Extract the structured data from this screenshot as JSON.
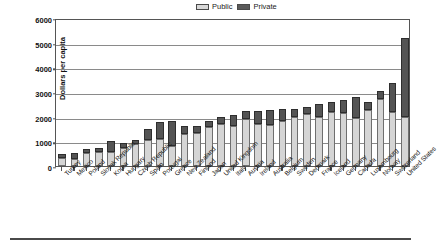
{
  "legend": {
    "entries": [
      {
        "label": "Public",
        "color": "#d5d5d5",
        "key": "public"
      },
      {
        "label": "Private",
        "color": "#545454",
        "key": "private"
      }
    ]
  },
  "axes": {
    "y_title": "Dollars per capita",
    "y_ticks": [
      "0",
      "1000",
      "2000",
      "3000",
      "4000",
      "5000",
      "6000"
    ]
  },
  "chart_data": {
    "type": "bar",
    "subtype": "stacked-vertical",
    "title": "",
    "xlabel": "",
    "ylabel": "Dollars per capita",
    "ylim": [
      0,
      6000
    ],
    "ytick_interval": 1000,
    "grid": true,
    "legend_position": "top-center",
    "sorted": "ascending by total",
    "categories": [
      "Turkey",
      "Mexico",
      "Poland",
      "Slovak Republic",
      "Korea",
      "Hungary",
      "Czech Republic",
      "Spain",
      "Portugal",
      "Greece",
      "New Zealand",
      "Finland",
      "Japan",
      "United Kingdom",
      "Italy",
      "Austria",
      "Ireland",
      "Australia",
      "Belgium",
      "Sweden",
      "Denmark",
      "France",
      "Iceland",
      "Germany",
      "Canada",
      "Luxembourg",
      "Norway",
      "Switzerland",
      "United States"
    ],
    "series": [
      {
        "name": "Public",
        "color": "#d5d5d5",
        "values": [
          310,
          270,
          510,
          550,
          560,
          740,
          900,
          1050,
          1080,
          830,
          1300,
          1350,
          1600,
          1690,
          1640,
          1920,
          1700,
          1670,
          1840,
          2000,
          2100,
          2000,
          2180,
          2160,
          1960,
          2280,
          2700,
          2200,
          2000
        ]
      },
      {
        "name": "Private",
        "color": "#545454",
        "values": [
          170,
          250,
          190,
          170,
          440,
          180,
          160,
          460,
          700,
          980,
          330,
          280,
          230,
          280,
          420,
          330,
          540,
          590,
          470,
          330,
          290,
          530,
          400,
          520,
          850,
          330,
          340,
          1180,
          3200
        ]
      }
    ],
    "totals": [
      480,
      520,
      700,
      720,
      1000,
      920,
      1060,
      1510,
      1780,
      1810,
      1630,
      1630,
      1830,
      1970,
      2060,
      2250,
      2240,
      2260,
      2310,
      2330,
      2390,
      2530,
      2580,
      2680,
      2810,
      2610,
      3040,
      3380,
      5200
    ]
  }
}
